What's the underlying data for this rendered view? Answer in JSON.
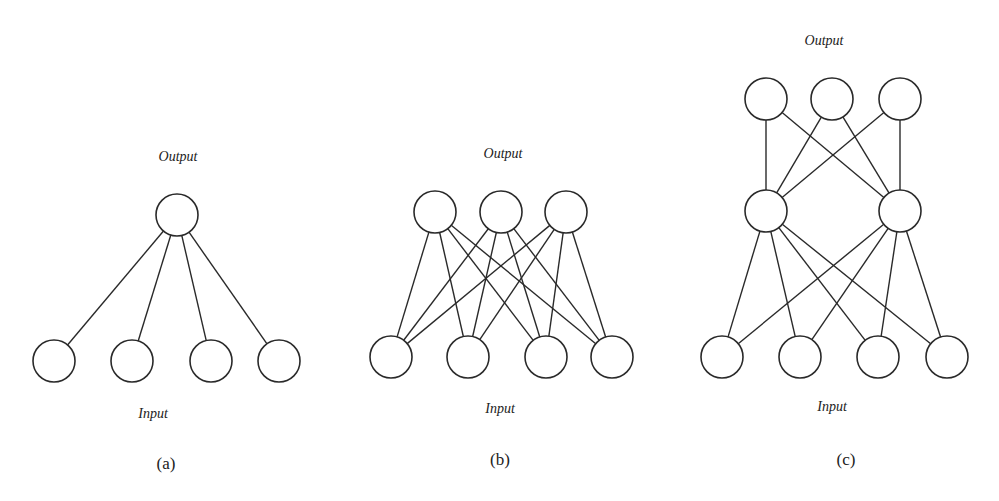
{
  "figure": {
    "panels": [
      {
        "id": "a",
        "caption": "(a)",
        "output_label": "Output",
        "input_label": "Input",
        "layers": [
          {
            "name": "input",
            "nodes": [
              [
                54,
                361
              ],
              [
                132,
                361
              ],
              [
                211,
                361
              ],
              [
                279,
                361
              ]
            ]
          },
          {
            "name": "output",
            "nodes": [
              [
                177,
                215
              ]
            ]
          }
        ],
        "edges": [
          [
            [
              54,
              361
            ],
            [
              177,
              215
            ]
          ],
          [
            [
              132,
              361
            ],
            [
              177,
              215
            ]
          ],
          [
            [
              211,
              361
            ],
            [
              177,
              215
            ]
          ],
          [
            [
              279,
              361
            ],
            [
              177,
              215
            ]
          ]
        ],
        "label_positions": {
          "output": [
            178,
            161
          ],
          "input": [
            153,
            418
          ],
          "caption": [
            166,
            468
          ]
        }
      },
      {
        "id": "b",
        "caption": "(b)",
        "output_label": "Output",
        "input_label": "Input",
        "layers": [
          {
            "name": "input",
            "nodes": [
              [
                391,
                357
              ],
              [
                468,
                357
              ],
              [
                546,
                357
              ],
              [
                612,
                357
              ]
            ]
          },
          {
            "name": "output",
            "nodes": [
              [
                435,
                212
              ],
              [
                501,
                212
              ],
              [
                566,
                212
              ]
            ]
          }
        ],
        "edges": "fully-connected input→output",
        "label_positions": {
          "output": [
            503,
            158
          ],
          "input": [
            500,
            413
          ],
          "caption": [
            500,
            464
          ]
        }
      },
      {
        "id": "c",
        "caption": "(c)",
        "output_label": "Output",
        "input_label": "Input",
        "layers": [
          {
            "name": "input",
            "nodes": [
              [
                722,
                357
              ],
              [
                800,
                357
              ],
              [
                878,
                357
              ],
              [
                947,
                357
              ]
            ]
          },
          {
            "name": "hidden",
            "nodes": [
              [
                766,
                211
              ],
              [
                900,
                211
              ]
            ]
          },
          {
            "name": "output",
            "nodes": [
              [
                766,
                99
              ],
              [
                832,
                99
              ],
              [
                900,
                99
              ]
            ]
          }
        ],
        "edges": "fully-connected input→hidden, hidden→output",
        "label_positions": {
          "output": [
            824,
            45
          ],
          "input": [
            832,
            411
          ],
          "caption": [
            846,
            464
          ]
        }
      }
    ],
    "node_radius": 21,
    "stroke_color": "#2a2a2a",
    "background": "#ffffff"
  }
}
